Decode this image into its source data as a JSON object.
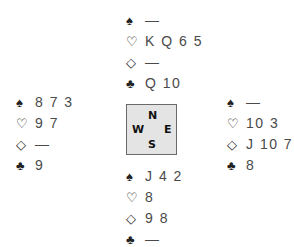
{
  "suit_icons": {
    "spades": "♠",
    "hearts": "♡",
    "diamonds": "◇",
    "clubs": "♣"
  },
  "compass": {
    "north": "N",
    "west": "W",
    "east": "E",
    "south": "S",
    "background": "#e4e4e4",
    "border": "#6a6a6a"
  },
  "hands": {
    "north": {
      "spades": "—",
      "hearts": "K Q 6 5",
      "diamonds": "—",
      "clubs": "Q 10"
    },
    "west": {
      "spades": "8 7 3",
      "hearts": "9 7",
      "diamonds": "—",
      "clubs": "9"
    },
    "east": {
      "spades": "—",
      "hearts": "10 3",
      "diamonds": "J 10 7",
      "clubs": "8"
    },
    "south": {
      "spades": "J 4 2",
      "hearts": "8",
      "diamonds": "9 8",
      "clubs": "—"
    }
  }
}
